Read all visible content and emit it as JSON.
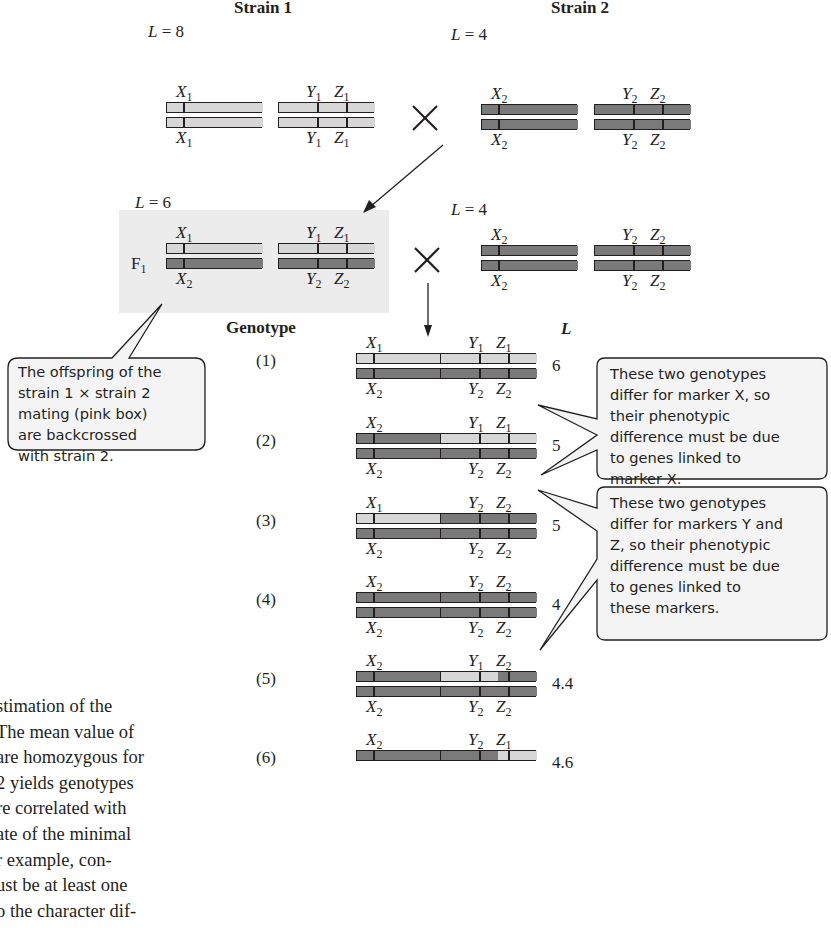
{
  "colors": {
    "strain1": "#d7d7d7",
    "strain2": "#7a7a7a",
    "f1_box": "#ececec",
    "ink": "#231f20",
    "callout_fill": "#f4f4f4"
  },
  "headers": {
    "strain1": "Strain 1",
    "strain2": "Strain 2",
    "genotype": "Genotype",
    "l_column": "L"
  },
  "parental_cross": {
    "strain1": {
      "L_label": "L = 8",
      "L": 8,
      "top": [
        "X1",
        "Y1",
        "Z1"
      ],
      "bottom": [
        "X1",
        "Y1",
        "Z1"
      ]
    },
    "strain2": {
      "L_label": "L = 4",
      "L": 4,
      "top": [
        "X2",
        "Y2",
        "Z2"
      ],
      "bottom": [
        "X2",
        "Y2",
        "Z2"
      ]
    },
    "cross_symbol": "×"
  },
  "backcross": {
    "f1": {
      "label": "F1",
      "L_label": "L = 6",
      "L": 6,
      "top": [
        "X1",
        "Y1",
        "Z1"
      ],
      "bottom": [
        "X2",
        "Y2",
        "Z2"
      ]
    },
    "strain2": {
      "L_label": "L = 4",
      "L": 4,
      "top": [
        "X2",
        "Y2",
        "Z2"
      ],
      "bottom": [
        "X2",
        "Y2",
        "Z2"
      ]
    },
    "cross_symbol": "×"
  },
  "genotypes": [
    {
      "id": "(1)",
      "L": "6",
      "top": [
        "X1",
        "Y1",
        "Z1"
      ],
      "bottom": [
        "X2",
        "Y2",
        "Z2"
      ],
      "x_top": "s1",
      "yz_top": [
        "s1",
        "s1",
        "s1",
        "s1"
      ]
    },
    {
      "id": "(2)",
      "L": "5",
      "top": [
        "X2",
        "Y1",
        "Z1"
      ],
      "bottom": [
        "X2",
        "Y2",
        "Z2"
      ],
      "x_top": "s2",
      "yz_top": [
        "s1",
        "s1",
        "s1",
        "s1"
      ]
    },
    {
      "id": "(3)",
      "L": "5",
      "top": [
        "X1",
        "Y2",
        "Z2"
      ],
      "bottom": [
        "X2",
        "Y2",
        "Z2"
      ],
      "x_top": "s1",
      "yz_top": [
        "s2",
        "s2",
        "s2",
        "s2"
      ]
    },
    {
      "id": "(4)",
      "L": "4",
      "top": [
        "X2",
        "Y2",
        "Z2"
      ],
      "bottom": [
        "X2",
        "Y2",
        "Z2"
      ],
      "x_top": "s2",
      "yz_top": [
        "s2",
        "s2",
        "s2",
        "s2"
      ]
    },
    {
      "id": "(5)",
      "L": "4.4",
      "top": [
        "X2",
        "Y1",
        "Z2"
      ],
      "bottom": [
        "X2",
        "Y2",
        "Z2"
      ],
      "x_top": "s2",
      "yz_top": [
        "s1",
        "s1",
        "s2",
        "s2"
      ]
    },
    {
      "id": "(6)",
      "L": "4.6",
      "top": [
        "X2",
        "Y2",
        "Z1"
      ],
      "bottom": [],
      "x_top": "s2",
      "yz_top": [
        "s2",
        "s2",
        "s1",
        "s1"
      ]
    }
  ],
  "callouts": {
    "backcross_note": [
      "The offspring of the",
      "strain 1 × strain 2",
      "mating (pink box)",
      "are backcrossed",
      "with strain 2."
    ],
    "marker_x_note": [
      "These two genotypes",
      "differ for marker X, so",
      "their phenotypic",
      "difference must be due",
      "to genes linked to",
      "marker X."
    ],
    "marker_yz_note": [
      "These two genotypes",
      "differ for markers Y and",
      "Z, so their phenotypic",
      "difference must be due",
      "to genes linked to",
      "these markers."
    ]
  },
  "body_text": [
    "stimation of the",
    "The mean value of",
    "are homozygous for",
    "2 yields genotypes",
    "re correlated with",
    "ate of the minimal",
    "r example, con-",
    "ust be at least one",
    "o the character dif-"
  ]
}
